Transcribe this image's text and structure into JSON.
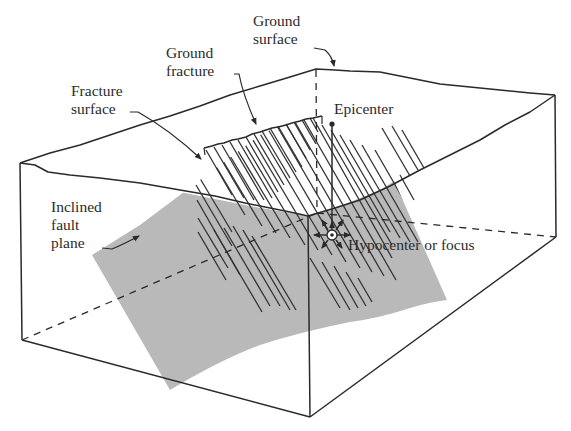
{
  "figure": {
    "type": "block diagram"
  },
  "labels": {
    "ground_surface": {
      "line1": "Ground",
      "line2": "surface"
    },
    "ground_fracture": {
      "line1": "Ground",
      "line2": "fracture"
    },
    "fracture_surface": {
      "line1": "Fracture",
      "line2": "surface"
    },
    "epicenter": "Epicenter",
    "inclined_fault_plane": {
      "line1": "Inclined",
      "line2": "fault",
      "line3": "plane"
    },
    "hypocenter": "Hypocenter or focus"
  },
  "colors": {
    "outline": "#2a2a2a",
    "fault_plane_fill": "#b9b9b9",
    "hatch": "#333333",
    "background": "#ffffff",
    "text": "#2b2b2b"
  }
}
